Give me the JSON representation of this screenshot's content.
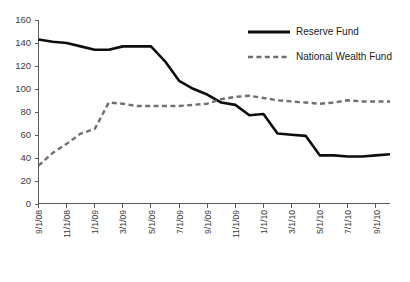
{
  "chart_data": {
    "type": "line",
    "title": "",
    "subtitle": "",
    "xlabel": "",
    "ylabel": "",
    "ylim": [
      0,
      160
    ],
    "ytick_step": 20,
    "yticks": [
      "0",
      "20",
      "40",
      "60",
      "80",
      "100",
      "120",
      "140",
      "160"
    ],
    "grid": false,
    "legend_position": "top-right",
    "x": [
      "9/1/08",
      "10/1/08",
      "11/1/08",
      "12/1/08",
      "1/1/09",
      "2/1/09",
      "3/1/09",
      "4/1/09",
      "5/1/09",
      "6/1/09",
      "7/1/09",
      "8/1/09",
      "9/1/09",
      "10/1/09",
      "11/1/09",
      "12/1/09",
      "1/1/10",
      "2/1/10",
      "3/1/10",
      "4/1/10",
      "5/1/10",
      "6/1/10",
      "7/1/10",
      "8/1/10",
      "9/1/10",
      "10/1/10"
    ],
    "xtick_labels": [
      "9/1/08",
      "11/1/08",
      "1/1/09",
      "3/1/09",
      "5/1/09",
      "7/1/09",
      "9/1/09",
      "11/1/09",
      "1/1/10",
      "3/1/10",
      "5/1/10",
      "7/1/10",
      "9/1/10"
    ],
    "series": [
      {
        "name": "Reserve Fund",
        "style": "solid",
        "color": "#0d0d0d",
        "values": [
          143,
          141,
          140,
          137,
          134,
          134,
          137,
          137,
          137,
          124,
          107,
          100,
          95,
          88,
          86,
          77,
          78,
          61,
          60,
          59,
          42,
          42,
          41,
          41,
          42,
          43
        ]
      },
      {
        "name": "National Wealth Fund",
        "style": "dashed",
        "color": "#6f6f6f",
        "values": [
          33,
          44,
          52,
          61,
          65,
          88,
          87,
          85,
          85,
          85,
          85,
          86,
          87,
          91,
          93,
          94,
          92,
          90,
          89,
          88,
          87,
          88,
          90,
          89,
          89,
          89
        ]
      }
    ]
  },
  "legend": {
    "items": [
      {
        "label": "Reserve Fund",
        "marker": "solid-line-swatch"
      },
      {
        "label": "National Wealth Fund",
        "marker": "dashed-line-swatch"
      }
    ]
  }
}
